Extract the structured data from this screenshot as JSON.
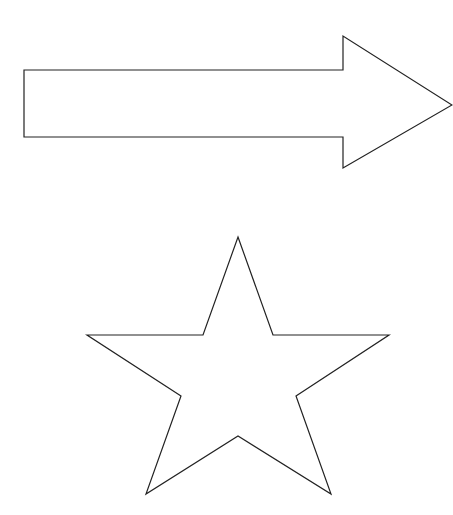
{
  "canvas": {
    "width": 453,
    "height": 515,
    "background": "#ffffff"
  },
  "style": {
    "stroke": "#222222",
    "fill": "#ffffff",
    "stroke_width": 1.2
  },
  "shapes": {
    "arrow": {
      "type": "right-arrow",
      "points": "24,70 343,70 343,36 452,105 343,168 343,137 24,137"
    },
    "star": {
      "type": "five-point-star",
      "points": "238,237 273,335 389,335 296,396 331,494 238,436 146,494 181,396 87,335 203,335"
    }
  }
}
